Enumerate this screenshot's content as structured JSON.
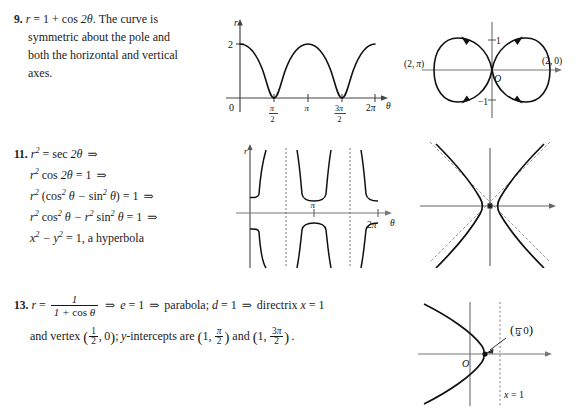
{
  "page": {
    "background": "#ffffff",
    "ink": "#1a1a1a",
    "width": 578,
    "height": 413
  },
  "problems": [
    {
      "number": "9.",
      "equation_plain": "r = 1 + cos 2θ",
      "text_lines": [
        ". The curve is",
        "symmetric about the pole and",
        "both the horizontal and vertical",
        "axes."
      ],
      "figures": [
        {
          "id": "fig-9-cartesian",
          "type": "line",
          "caption": "Cartesian graph of r = 1 + cos 2θ",
          "xlabel": "θ",
          "ylabel": "r",
          "origin_label": "0",
          "y_ticks": [
            {
              "value": 2,
              "label": "2"
            }
          ],
          "x_ticks": [
            {
              "value": 1.5708,
              "label_num": "π",
              "label_den": "2"
            },
            {
              "value": 3.1416,
              "label": "π"
            },
            {
              "value": 4.7124,
              "label_num": "3π",
              "label_den": "2"
            },
            {
              "value": 6.2832,
              "label": "2π"
            }
          ],
          "xlim": [
            0,
            6.6
          ],
          "ylim": [
            0,
            2.35
          ],
          "grid": false
        },
        {
          "id": "fig-9-polar",
          "type": "polar",
          "caption": "Polar graph of r = 1 + cos 2θ, two petals",
          "origin_label": "O",
          "y_ticks": [
            {
              "value": 1,
              "label": "1"
            },
            {
              "value": -1,
              "label": "-1"
            }
          ],
          "point_labels": [
            {
              "label": "(2, π)",
              "x": -2,
              "y": 0
            },
            {
              "label": "(2, 0)",
              "x": 2,
              "y": 0
            }
          ],
          "has_direction_arrows": true
        }
      ]
    },
    {
      "number": "11.",
      "derivation_lines": [
        "r² = sec 2θ   ⇒",
        "r² cos 2θ = 1   ⇒",
        "r² (cos² θ − sin² θ) = 1   ⇒",
        "r² cos² θ − r² sin² θ = 1   ⇒",
        "x² − y² = 1, a hyperbola"
      ],
      "conclusion": "x² − y² = 1, a hyperbola",
      "figures": [
        {
          "id": "fig-11-cartesian",
          "type": "line",
          "caption": "Graph of r = ±sqrt(sec 2θ) branches with vertical asymptotes",
          "xlabel": "θ",
          "ylabel": "r",
          "x_ticks": [
            {
              "value": 3.1416,
              "label": "π"
            },
            {
              "value": 6.2832,
              "label": "2π"
            }
          ],
          "asymptotes": [
            0.7854,
            2.3562,
            3.927,
            5.4978
          ],
          "xlim": [
            0,
            6.6
          ],
          "grid": false
        },
        {
          "id": "fig-11-hyperbola",
          "type": "conic",
          "caption": "Hyperbola x² − y² = 1 with dashed asymptotes y = ±x",
          "dashed_asymptotes": true
        }
      ]
    },
    {
      "number": "13.",
      "equation_numerator": "1",
      "equation_denominator": "1 + cos θ",
      "steps": [
        "e = 1",
        "parabola; d = 1",
        "directrix x = 1"
      ],
      "line2_prefix": "and vertex",
      "vertex_label": "(½, 0)",
      "line2_middle": "; y-intercepts are",
      "intercept1": "(1, π/2)",
      "intercept_join": "and",
      "intercept2": "(1, 3π/2)",
      "figures": [
        {
          "id": "fig-13-parabola",
          "type": "conic",
          "caption": "Leftward-opening parabola with vertex (1/2, 0) and directrix x = 1",
          "origin_label": "O",
          "vertex_label_num": "1",
          "vertex_label_den": "2",
          "vertex_label_suffix": ", 0",
          "directrix_label": "x = 1",
          "directrix_dashed": true,
          "has_callout_arrow": true
        }
      ]
    }
  ]
}
